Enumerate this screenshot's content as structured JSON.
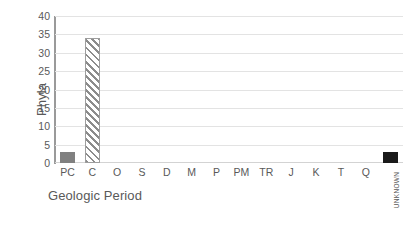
{
  "chart_data": {
    "type": "bar",
    "title": "",
    "xlabel": "Geologic Period",
    "ylabel": "Phyla",
    "categories": [
      "PC",
      "C",
      "O",
      "S",
      "D",
      "M",
      "P",
      "PM",
      "TR",
      "J",
      "K",
      "T",
      "Q",
      "UNKNOWN"
    ],
    "values": [
      3,
      34,
      0,
      0,
      0,
      0,
      0,
      0,
      0,
      0,
      0,
      0,
      0,
      3
    ],
    "ylim": [
      0,
      40
    ],
    "ytick_labels": [
      "40",
      "35",
      "30",
      "25",
      "20",
      "15",
      "10",
      "5",
      "0"
    ],
    "ytick_values": [
      40,
      35,
      30,
      25,
      20,
      15,
      10,
      5,
      0
    ],
    "ytick_step": 5,
    "grid": true,
    "legend": "none",
    "bar_styles": [
      "solid-gray",
      "hatch-gray",
      "empty",
      "empty",
      "empty",
      "empty",
      "empty",
      "empty",
      "empty",
      "empty",
      "empty",
      "empty",
      "empty",
      "solid-black"
    ],
    "colors": {
      "solid_gray": "#808080",
      "hatch_gray": "#8c8c8c",
      "solid_black": "#1a1a1a",
      "gridline": "#e3e3e3",
      "axis_line": "#9a9a9a",
      "text": "#595959",
      "background": "#ffffff"
    },
    "rotated_labels": [
      "UNKNOWN"
    ]
  }
}
